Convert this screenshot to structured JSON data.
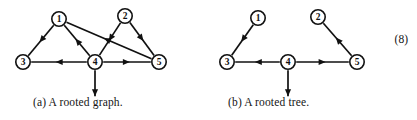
{
  "figure": {
    "background_color": "#ffffff",
    "ink_color": "#111111",
    "equation_number": "(8)",
    "panels": [
      {
        "id": "a",
        "caption": "(a)  A rooted graph.",
        "nodes": [
          {
            "label": "1",
            "x": 59,
            "y": 19,
            "r": 7.2
          },
          {
            "label": "2",
            "x": 125,
            "y": 16,
            "r": 7.2
          },
          {
            "label": "3",
            "x": 23,
            "y": 62,
            "r": 7.2
          },
          {
            "label": "4",
            "x": 95,
            "y": 62,
            "r": 7.2
          },
          {
            "label": "5",
            "x": 159,
            "y": 62,
            "r": 7.2
          }
        ],
        "edges": [
          {
            "from": "1",
            "to": "3",
            "name": "edge-1-to-3"
          },
          {
            "from": "4",
            "to": "1",
            "name": "edge-4-to-1"
          },
          {
            "from": "5",
            "to": "1",
            "name": "edge-5-to-1"
          },
          {
            "from": "2",
            "to": "4",
            "name": "edge-2-to-4"
          },
          {
            "from": "2",
            "to": "5",
            "name": "edge-2-to-5"
          },
          {
            "from": "4",
            "to": "3",
            "name": "edge-4-to-3"
          },
          {
            "from": "4",
            "to": "5",
            "name": "edge-4-to-5"
          }
        ],
        "root": {
          "node": "4",
          "marker": "down-arrow",
          "length": 26
        }
      },
      {
        "id": "b",
        "caption": "(b)  A rooted tree.",
        "nodes": [
          {
            "label": "1",
            "x": 258,
            "y": 18,
            "r": 7.2
          },
          {
            "label": "2",
            "x": 318,
            "y": 17,
            "r": 7.2
          },
          {
            "label": "3",
            "x": 227,
            "y": 62,
            "r": 7.2
          },
          {
            "label": "4",
            "x": 288,
            "y": 62,
            "r": 7.2
          },
          {
            "label": "5",
            "x": 357,
            "y": 62,
            "r": 7.2
          }
        ],
        "edges": [
          {
            "from": "1",
            "to": "3",
            "name": "edge-1-to-3"
          },
          {
            "from": "5",
            "to": "2",
            "name": "edge-5-to-2"
          },
          {
            "from": "4",
            "to": "3",
            "name": "edge-4-to-3"
          },
          {
            "from": "4",
            "to": "5",
            "name": "edge-4-to-5"
          }
        ],
        "root": {
          "node": "4",
          "marker": "down-arrow",
          "length": 26
        }
      }
    ]
  }
}
